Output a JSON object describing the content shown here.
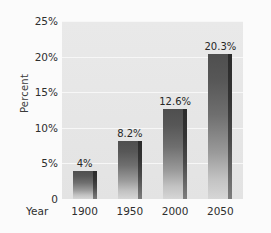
{
  "chart_data": {
    "type": "bar",
    "title": "",
    "xlabel": "Year",
    "ylabel": "Percent",
    "categories": [
      "1900",
      "1950",
      "2000",
      "2050"
    ],
    "values": [
      4,
      8.2,
      12.6,
      20.3
    ],
    "value_labels": [
      "4%",
      "8.2%",
      "12.6%",
      "20.3%"
    ],
    "ylim": [
      0,
      25
    ],
    "ytick_values": [
      25,
      20,
      15,
      10,
      5,
      0
    ],
    "ytick_labels": [
      "25%",
      "20%",
      "15%",
      "10%",
      "5%",
      "0"
    ],
    "grid": true,
    "legend": "none",
    "series": [
      {
        "name": "Percent",
        "values": [
          4,
          8.2,
          12.6,
          20.3
        ]
      }
    ]
  },
  "colors": {
    "page_background": "#fbfbfb",
    "plot_background": "#e7e7e7",
    "gridline": "#f7f7f7",
    "bar_top": "#4f4f4f",
    "bar_bottom": "#d6d6d6",
    "bar_shadow": "#2b2b2b",
    "text": "#2e2e2e"
  }
}
